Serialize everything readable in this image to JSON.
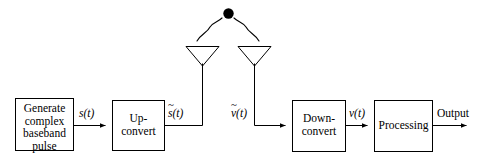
{
  "figure": {
    "type": "block-diagram",
    "stroke_color": "#000000",
    "background_color": "#ffffff",
    "target_dot_color": "#000000"
  },
  "blocks": [
    {
      "id": "generate",
      "label": "Generate\ncomplex\nbaseband\npulse"
    },
    {
      "id": "upconvert",
      "label": "Up-\nconvert"
    },
    {
      "id": "downconvert",
      "label": "Down-\nconvert"
    },
    {
      "id": "processing",
      "label": "Processing"
    }
  ],
  "signals": {
    "baseband_tx": {
      "base": "s",
      "arg": "(t)",
      "tilde": false
    },
    "rf_tx": {
      "base": "s",
      "arg": "(t)",
      "tilde": true
    },
    "rf_rx": {
      "base": "v",
      "arg": "(t)",
      "tilde": true
    },
    "baseband_rx": {
      "base": "v",
      "arg": "(t)",
      "tilde": false
    }
  },
  "output": {
    "label": "Output"
  },
  "antennas": [
    {
      "id": "tx-antenna",
      "name": "transmit antenna"
    },
    {
      "id": "rx-antenna",
      "name": "receive antenna"
    }
  ],
  "target": {
    "name": "target",
    "shape": "filled-circle"
  },
  "propagation": [
    {
      "id": "outgoing-wave",
      "name": "transmitted wave path"
    },
    {
      "id": "returning-wave",
      "name": "reflected wave path"
    }
  ]
}
